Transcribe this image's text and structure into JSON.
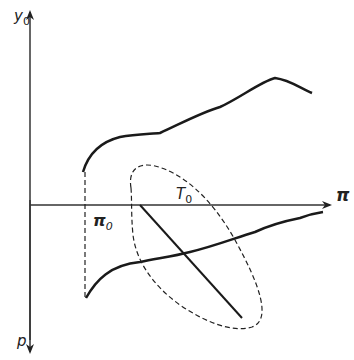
{
  "diagram": {
    "axes": {
      "y_top_label": "y",
      "y_top_sub": "0",
      "y_bottom_label": "p",
      "x_label": "π"
    },
    "labels": {
      "pi0_main": "π",
      "pi0_sub": "0",
      "T0_main": "T",
      "T0_sub": "0"
    },
    "colors": {
      "line": "#1a1a1a",
      "axis": "#333333"
    }
  }
}
